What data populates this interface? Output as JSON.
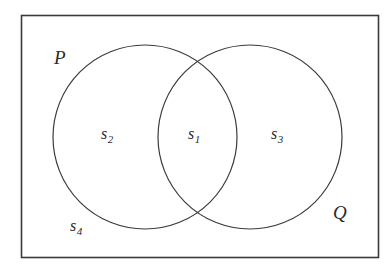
{
  "figure": {
    "type": "venn-diagram",
    "background_color": "#ffffff",
    "stroke_color": "#3a3a3a",
    "text_color": "#2b2b2b",
    "universe": {
      "shape": "rectangle",
      "x": 21,
      "y": 15,
      "width": 357,
      "height": 242
    },
    "circles": [
      {
        "id": "P",
        "cx": 145,
        "cy": 137,
        "r": 92
      },
      {
        "id": "Q",
        "cx": 250,
        "cy": 137,
        "r": 92
      }
    ],
    "set_labels": [
      {
        "id": "P",
        "text": "P"
      },
      {
        "id": "Q",
        "text": "Q"
      }
    ],
    "region_labels": [
      {
        "id": "s1",
        "base": "s",
        "subscript": "1",
        "region": "intersection P and Q"
      },
      {
        "id": "s2",
        "base": "s",
        "subscript": "2",
        "region": "P only"
      },
      {
        "id": "s3",
        "base": "s",
        "subscript": "3",
        "region": "Q only"
      },
      {
        "id": "s4",
        "base": "s",
        "subscript": "4",
        "region": "outside both circles"
      }
    ]
  }
}
